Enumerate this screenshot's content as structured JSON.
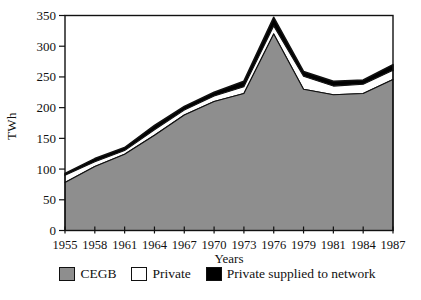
{
  "chart_data": {
    "type": "area",
    "stacked": true,
    "title": "",
    "xlabel": "Years",
    "ylabel": "TWh",
    "categories": [
      1955,
      1958,
      1961,
      1964,
      1967,
      1970,
      1973,
      1976,
      1979,
      1981,
      1984,
      1987
    ],
    "series": [
      {
        "name": "CEGB",
        "color": "#8e8e8e",
        "values": [
          78,
          104,
          124,
          155,
          188,
          210,
          223,
          320,
          230,
          221,
          223,
          246
        ]
      },
      {
        "name": "Private",
        "color": "#ffffff",
        "values": [
          12,
          8,
          6,
          9,
          8,
          9,
          11,
          13,
          21,
          14,
          15,
          15
        ]
      },
      {
        "name": "Private supplied to network",
        "color": "#000000",
        "values": [
          3,
          5,
          5,
          7,
          6,
          6,
          9,
          14,
          8,
          8,
          7,
          9
        ]
      }
    ],
    "ylim": [
      0,
      350
    ],
    "ytick_step": 50,
    "grid": false,
    "legend_position": "bottom",
    "axis_color": "#111111",
    "background_color": "#ffffff"
  }
}
